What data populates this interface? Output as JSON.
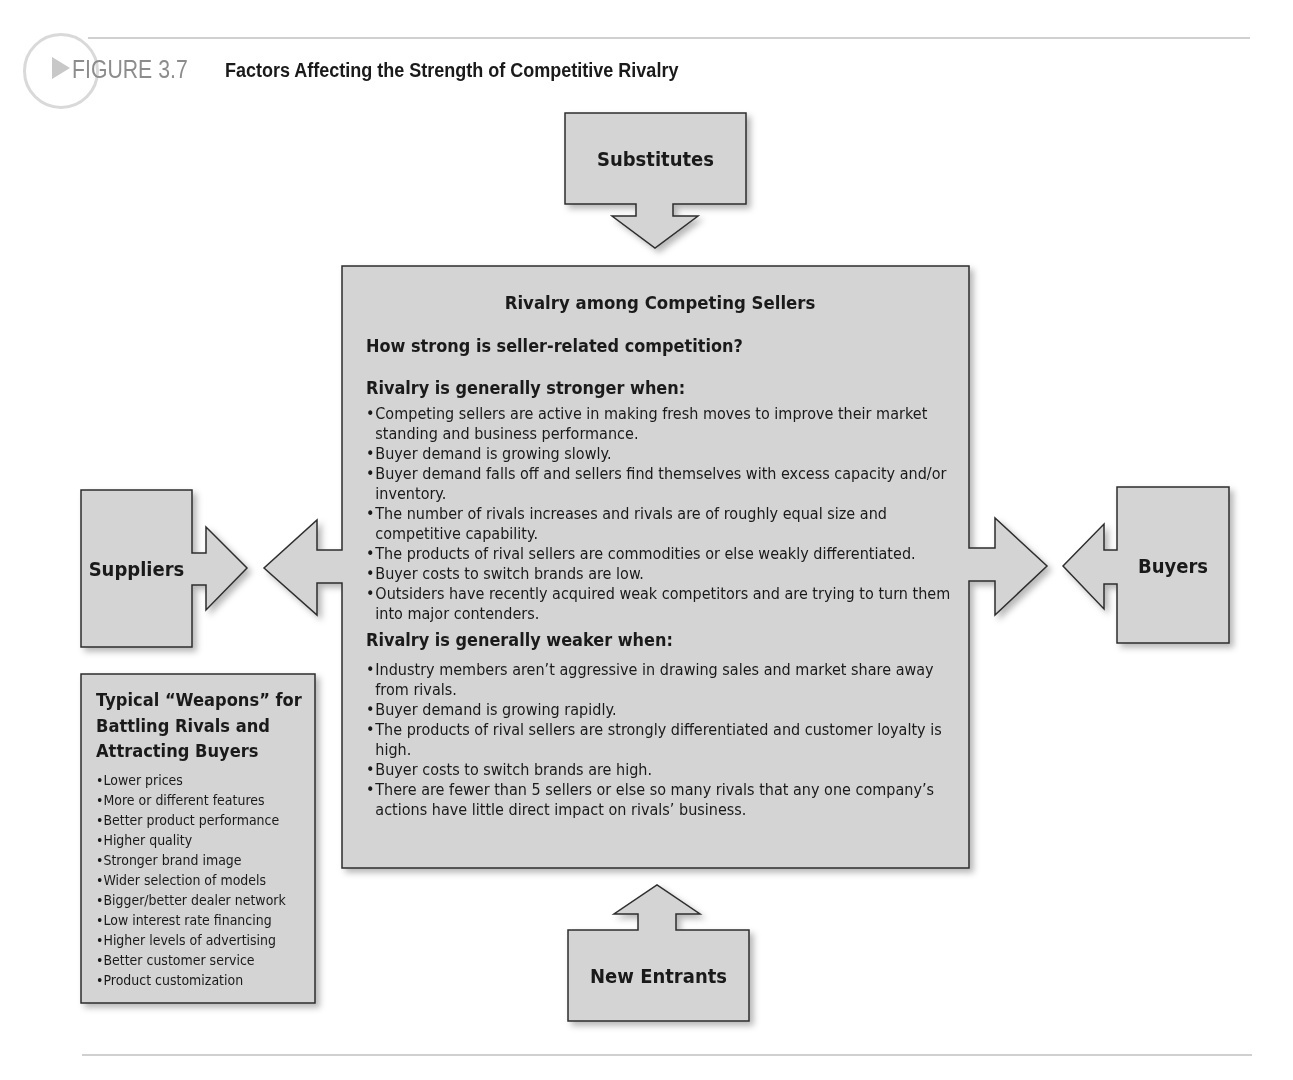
{
  "figure": {
    "number_label": "FIGURE 3.7",
    "title": "Factors Affecting the Strength of Competitive Rivalry",
    "icon": "play-triangle-in-circle-icon"
  },
  "colors": {
    "box_fill": "#d4d4d4",
    "box_stroke": "#333333",
    "rule": "#d0d0d0",
    "figure_label": "#8c8c8c"
  },
  "forces": {
    "substitutes": "Substitutes",
    "suppliers": "Suppliers",
    "buyers": "Buyers",
    "new_entrants": "New Entrants"
  },
  "center": {
    "title": "Rivalry among Competing Sellers",
    "question": "How strong is seller-related competition?",
    "stronger_heading": "Rivalry is generally stronger when:",
    "stronger_items": [
      "Competing sellers are active in making fresh moves to improve their market standing and business performance.",
      "Buyer demand is growing slowly.",
      "Buyer demand falls off and sellers find themselves with excess capacity and/or inventory.",
      "The number of rivals increases and rivals are of roughly equal size and competitive capability.",
      "The products of rival sellers are commodities or else weakly differentiated.",
      "Buyer costs to switch brands are low.",
      "Outsiders have recently acquired weak competitors and are trying to turn them into major contenders."
    ],
    "weaker_heading": "Rivalry is generally weaker when:",
    "weaker_items": [
      "Industry members aren’t aggressive in drawing sales and market share away from rivals.",
      "Buyer demand is growing rapidly.",
      "The products of rival sellers are strongly differentiated and customer loyalty is high.",
      "Buyer costs to switch brands are high.",
      "There are fewer than 5 sellers or else so many rivals that any one company’s actions have little direct impact on rivals’ business."
    ]
  },
  "weapons": {
    "title": "Typical “Weapons” for Battling Rivals and Attracting Buyers",
    "items": [
      "Lower prices",
      "More or different features",
      "Better product performance",
      "Higher quality",
      "Stronger brand image",
      "Wider selection of models",
      "Bigger/better dealer network",
      "Low interest rate financing",
      "Higher levels of advertising",
      "Better customer service",
      "Product customization"
    ]
  }
}
